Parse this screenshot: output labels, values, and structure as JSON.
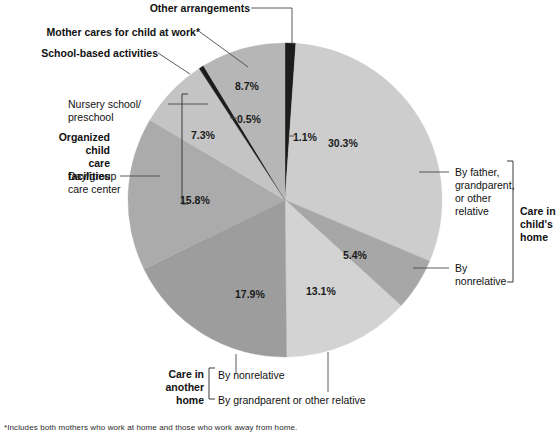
{
  "chart_data": {
    "type": "pie",
    "title": "",
    "legend_position": "callouts",
    "center": {
      "x": 285,
      "y": 200
    },
    "radius": 157,
    "start_angle_deg": 0,
    "direction": "clockwise",
    "slices": [
      {
        "label": "Other arrangements",
        "value": 1.1,
        "display": "1.1%",
        "color": "#1c1c1c",
        "group": ""
      },
      {
        "label": "By father, grandparent, or other relative",
        "value": 30.3,
        "display": "30.3%",
        "color": "#cdcdcd",
        "group": "Care in child's home"
      },
      {
        "label": "By nonrelative",
        "value": 5.4,
        "display": "5.4%",
        "color": "#a7a7a7",
        "group": "Care in child's home"
      },
      {
        "label": "By grandparent or other relative",
        "value": 13.1,
        "display": "13.1%",
        "color": "#d3d3d3",
        "group": "Care in another home"
      },
      {
        "label": "By nonrelative",
        "value": 17.9,
        "display": "17.9%",
        "color": "#9d9d9d",
        "group": "Care in another home"
      },
      {
        "label": "Day/group care center",
        "value": 15.8,
        "display": "15.8%",
        "color": "#ababab",
        "group": "Organized child care facilities"
      },
      {
        "label": "Nursery school/ preschool",
        "value": 7.3,
        "display": "7.3%",
        "color": "#c4c4c4",
        "group": "Organized child care facilities"
      },
      {
        "label": "School-based activities",
        "value": 0.5,
        "display": "0.5%",
        "color": "#1c1c1c",
        "group": ""
      },
      {
        "label": "Mother cares for child at work*",
        "value": 8.7,
        "display": "8.7%",
        "color": "#b6b6b6",
        "group": ""
      }
    ]
  },
  "percent_labels": {
    "p30_3": "30.3%",
    "p5_4": "5.4%",
    "p13_1": "13.1%",
    "p17_9": "17.9%",
    "p15_8": "15.8%",
    "p7_3": "7.3%",
    "p0_5": "0.5%",
    "p8_7": "8.7%",
    "p1_1": "1.1%"
  },
  "callouts": {
    "other_arrangements": "Other arrangements",
    "mother_cares": "Mother cares for child at work*",
    "school_based": "School-based activities",
    "nursery_line1": "Nursery school/",
    "nursery_line2": "preschool",
    "daygroup_line1": "Day/group",
    "daygroup_line2": "care center",
    "father_line1": "By father,",
    "father_line2": "grandparent,",
    "father_line3": "or other",
    "father_line4": "relative",
    "by_nonrelative_right_line1": "By",
    "by_nonrelative_right_line2": "nonrelative",
    "bottom_nonrelative": "By nonrelative",
    "bottom_grandparent": "By grandparent or other relative"
  },
  "group_labels": {
    "organized_line1": "Organized",
    "organized_line2": "child",
    "organized_line3": "care",
    "organized_line4": "facilities",
    "care_child_home_line1": "Care in",
    "care_child_home_line2": "child's",
    "care_child_home_line3": "home",
    "care_another_home_line1": "Care in",
    "care_another_home_line2": "another",
    "care_another_home_line3": "home"
  },
  "footnote": {
    "text": "*Includes both mothers who work at home and those who work away from home."
  },
  "colors": {
    "slice_darkest": "#1c1c1c",
    "slice_light": "#cdcdcd",
    "slice_lightest": "#d3d3d3",
    "leader_line": "#4a4a4a",
    "text": "#111111",
    "background": "#ffffff"
  }
}
